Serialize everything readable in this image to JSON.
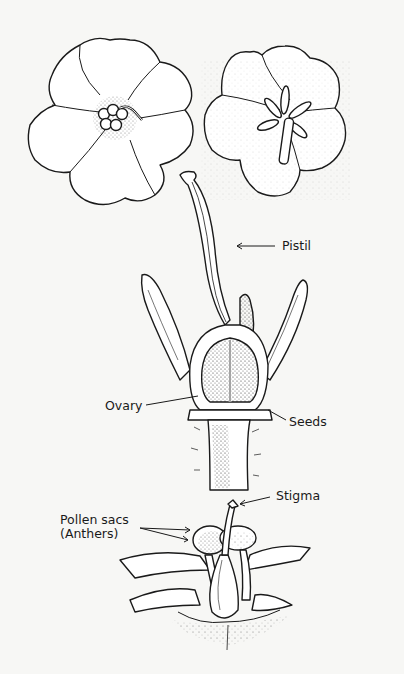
{
  "diagram": {
    "labels": {
      "pistil": "Pistil",
      "ovary": "Ovary",
      "seeds": "Seeds",
      "stigma": "Stigma",
      "pollen_sacs_line1": "Pollen sacs",
      "pollen_sacs_line2": "(Anthers)"
    },
    "figures": [
      {
        "name": "open-flower-front",
        "position": "top-left"
      },
      {
        "name": "flower-with-stamens",
        "position": "top-right"
      },
      {
        "name": "pistil-cross-section",
        "position": "center"
      },
      {
        "name": "flower-reproductive-parts",
        "position": "bottom"
      }
    ],
    "colors": {
      "ink": "#1a1a1a",
      "paper": "#f7f7f5",
      "stipple": "#555555"
    }
  }
}
